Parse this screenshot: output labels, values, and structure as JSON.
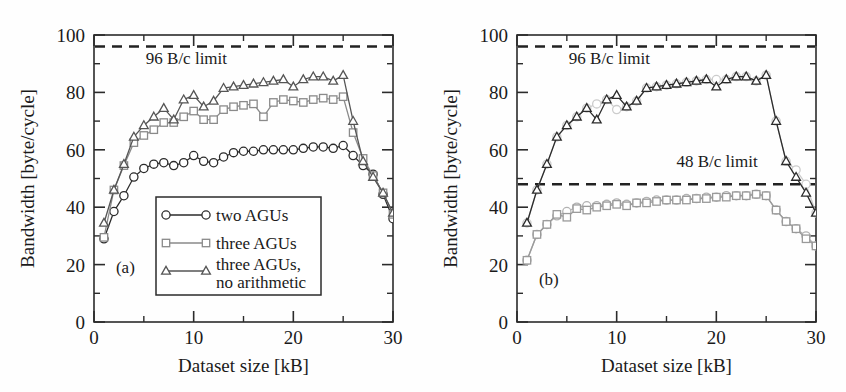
{
  "figure": {
    "background_color": "#fefefe",
    "axis_color": "#2b2b2b"
  },
  "chart_data": [
    {
      "type": "line",
      "panel": "(a)",
      "title": "",
      "xlabel": "Dataset size [kB]",
      "ylabel": "Bandwidth [byte/cycle]",
      "xlim": [
        0,
        30
      ],
      "ylim": [
        0,
        100
      ],
      "xticks": [
        0,
        10,
        20,
        30
      ],
      "xticks_minor": [
        5,
        15,
        25
      ],
      "yticks": [
        0,
        20,
        40,
        60,
        80,
        100
      ],
      "yticks_minor": [
        10,
        30,
        50,
        70,
        90
      ],
      "grid": false,
      "legend_position": "lower-center",
      "annotations": [
        {
          "text": "96 B/c limit",
          "x": 5.2,
          "y": 90,
          "kind": "limit-label"
        },
        {
          "text": "(a)",
          "x": 2.2,
          "y": 17,
          "kind": "panel-label"
        }
      ],
      "reference_lines": [
        {
          "label": "96 B/c limit",
          "value": 96,
          "style": "dashed",
          "color": "#222222"
        }
      ],
      "x": [
        1,
        2,
        3,
        4,
        5,
        6,
        7,
        8,
        9,
        10,
        11,
        12,
        13,
        14,
        15,
        16,
        17,
        18,
        19,
        20,
        21,
        22,
        23,
        24,
        25,
        26,
        27,
        28,
        29,
        30
      ],
      "series": [
        {
          "name": "two AGUs",
          "marker": "circle",
          "color": "#2b2b2b",
          "values": [
            29,
            38.5,
            44,
            50.5,
            53.5,
            55,
            55.5,
            54.5,
            55.5,
            58,
            56,
            55.5,
            57.5,
            59,
            59.5,
            59.5,
            60,
            60,
            60,
            60,
            60.5,
            61,
            61,
            60.5,
            61.5,
            58,
            54.5,
            51.5,
            44.5,
            36
          ]
        },
        {
          "name": "three AGUs",
          "marker": "square",
          "color": "#8a8a8a",
          "values": [
            29.5,
            46,
            54.5,
            62.5,
            65,
            67,
            69.5,
            69.5,
            71.5,
            73.5,
            70.5,
            70.5,
            74,
            75,
            75.5,
            76,
            71.5,
            76.5,
            77.5,
            77,
            76.5,
            77.5,
            78,
            77.5,
            78.5,
            66,
            57,
            51,
            45,
            37.5
          ]
        },
        {
          "name": "three AGUs, no arithmetic",
          "marker": "triangle",
          "color": "#555555",
          "values": [
            34.5,
            46,
            55,
            64.5,
            68.5,
            71.5,
            74.5,
            70.5,
            77.5,
            79,
            75,
            77,
            81.5,
            82,
            82.5,
            83,
            83.5,
            84,
            84.5,
            82,
            84.5,
            85.5,
            85.5,
            84,
            86,
            70,
            56,
            50.5,
            45,
            38
          ]
        }
      ]
    },
    {
      "type": "line",
      "panel": "(b)",
      "title": "",
      "xlabel": "Dataset size [kB]",
      "ylabel": "Bandwidth [byte/cycle]",
      "xlim": [
        0,
        30
      ],
      "ylim": [
        0,
        100
      ],
      "xticks": [
        0,
        10,
        20,
        30
      ],
      "xticks_minor": [
        5,
        15,
        25
      ],
      "yticks": [
        0,
        20,
        40,
        60,
        80,
        100
      ],
      "yticks_minor": [
        10,
        30,
        50,
        70,
        90
      ],
      "grid": false,
      "legend_position": "lower-right",
      "annotations": [
        {
          "text": "96 B/c limit",
          "x": 5.2,
          "y": 90,
          "kind": "limit-label"
        },
        {
          "text": "48 B/c limit",
          "x": 16.0,
          "y": 54,
          "kind": "limit-label"
        },
        {
          "text": "(b)",
          "x": 2.2,
          "y": 13,
          "kind": "panel-label"
        }
      ],
      "reference_lines": [
        {
          "label": "96 B/c limit",
          "value": 96,
          "style": "dashed",
          "color": "#222222"
        },
        {
          "label": "48 B/c limit",
          "value": 48,
          "style": "dashed",
          "color": "#222222"
        }
      ],
      "x": [
        1,
        2,
        3,
        4,
        5,
        6,
        7,
        8,
        9,
        10,
        11,
        12,
        13,
        14,
        15,
        16,
        17,
        18,
        19,
        20,
        21,
        22,
        23,
        24,
        25,
        26,
        27,
        28,
        29,
        30
      ],
      "series": [
        {
          "name": "SNB",
          "marker": "circle",
          "color": "#b2b2b2",
          "values": [
            21.5,
            30.5,
            34,
            37,
            38.5,
            40,
            40.5,
            40.5,
            41,
            41.5,
            41,
            41.5,
            42,
            42.5,
            42.5,
            42.5,
            43,
            43,
            43.5,
            43.5,
            44,
            44,
            44,
            44.5,
            44,
            39,
            35,
            32.5,
            30,
            26.5
          ]
        },
        {
          "name": "IVB",
          "marker": "square",
          "color": "#9a9a9a",
          "values": [
            21.5,
            30.5,
            34,
            37.5,
            36.5,
            39.5,
            39,
            40,
            40.5,
            41,
            40.5,
            41.5,
            41.5,
            42,
            42.5,
            42.5,
            42.5,
            43,
            43,
            43.5,
            43.5,
            44,
            44,
            44.5,
            44,
            39,
            35,
            32.5,
            29,
            26.5
          ]
        },
        {
          "name": "HSW",
          "marker": "circle",
          "color": "#cccccc",
          "values": [
            34.5,
            46,
            55,
            64.5,
            68.5,
            71.5,
            74.5,
            76,
            77.5,
            74,
            75,
            77,
            81.5,
            82,
            82.5,
            83,
            83.5,
            84,
            84.5,
            84.5,
            84.5,
            85.5,
            85.5,
            84,
            86,
            70,
            56,
            53,
            48,
            38
          ]
        },
        {
          "name": "BDW",
          "marker": "triangle",
          "color": "#2b2b2b",
          "values": [
            34.5,
            46,
            55,
            64.5,
            68.5,
            71.5,
            74.5,
            70.5,
            77.5,
            79,
            75,
            77,
            81.5,
            82,
            82.5,
            83,
            83.5,
            84,
            84.5,
            82,
            84.5,
            85.5,
            85.5,
            84,
            86,
            70,
            56,
            50.5,
            45,
            38
          ]
        }
      ]
    }
  ],
  "panels": [
    {
      "id": "a",
      "label": "(a)",
      "ylabel": "Bandwidth [byte/cycle]",
      "xlabel": "Dataset size [kB]",
      "limit_label_96": "96 B/c limit",
      "xticklabels": [
        "0",
        "10",
        "20",
        "30"
      ],
      "yticklabels": [
        "0",
        "20",
        "40",
        "60",
        "80",
        "100"
      ],
      "legend": [
        {
          "label": "two AGUs",
          "marker": "circle",
          "color": "#2b2b2b"
        },
        {
          "label": "three AGUs",
          "marker": "square",
          "color": "#8a8a8a"
        },
        {
          "label": "three AGUs,",
          "label2": "no arithmetic",
          "marker": "triangle",
          "color": "#555555"
        }
      ]
    },
    {
      "id": "b",
      "label": "(b)",
      "ylabel": "Bandwidth [byte/cycle]",
      "xlabel": "Dataset size [kB]",
      "limit_label_96": "96 B/c limit",
      "limit_label_48": "48 B/c limit",
      "xticklabels": [
        "0",
        "10",
        "20",
        "30"
      ],
      "yticklabels": [
        "0",
        "20",
        "40",
        "60",
        "80",
        "100"
      ],
      "legend": [
        {
          "label": "SNB",
          "marker": "circle",
          "color": "#b2b2b2"
        },
        {
          "label": "IVB",
          "marker": "square",
          "color": "#9a9a9a"
        },
        {
          "label": "HSW",
          "marker": "circle",
          "color": "#cccccc"
        },
        {
          "label": "BDW",
          "marker": "triangle",
          "color": "#2b2b2b"
        }
      ]
    }
  ]
}
